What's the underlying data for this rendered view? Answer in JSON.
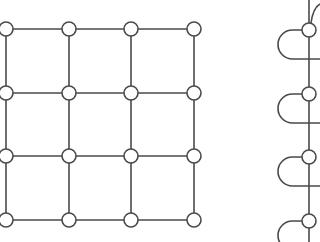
{
  "diagram": {
    "stroke_color": "#4a4a4a",
    "node_fill": "#ffffff",
    "node_radius": 7,
    "stroke_width": 1.6,
    "grid_graph": {
      "rows": 4,
      "cols": 4,
      "x": [
        6,
        69,
        131,
        194
      ],
      "y": [
        29,
        93,
        156,
        220
      ]
    },
    "chain_graph": {
      "x": 309,
      "nodes_y": [
        30,
        94,
        157,
        221
      ],
      "loop_left_x": 278,
      "loop_offset": 29
    }
  }
}
